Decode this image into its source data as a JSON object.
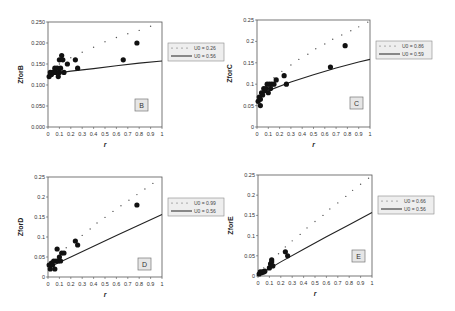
{
  "chart_data": [
    {
      "type": "scatter",
      "panel_label": "B",
      "ylabel": "ZforB",
      "xlabel": "r",
      "xlim": [
        0,
        1
      ],
      "ylim": [
        0,
        0.25
      ],
      "xticks": [
        "0",
        "0.1",
        "0.2",
        "0.3",
        "0.4",
        "0.5",
        "0.6",
        "0.7",
        "0.8",
        "0.9",
        "1"
      ],
      "yticks": [
        "0.000",
        "0.050",
        "0.100",
        "0.150",
        "0.200",
        "0.250"
      ],
      "ytick_values": [
        0,
        0.05,
        0.1,
        0.15,
        0.2,
        0.25
      ],
      "legend": [
        "U0 = 0.26",
        "U0 = 0.56"
      ],
      "legend_placement": "right",
      "points": [
        [
          0.01,
          0.12
        ],
        [
          0.02,
          0.13
        ],
        [
          0.03,
          0.125
        ],
        [
          0.04,
          0.13
        ],
        [
          0.05,
          0.13
        ],
        [
          0.06,
          0.14
        ],
        [
          0.07,
          0.13
        ],
        [
          0.08,
          0.14
        ],
        [
          0.09,
          0.12
        ],
        [
          0.1,
          0.16
        ],
        [
          0.1,
          0.13
        ],
        [
          0.11,
          0.14
        ],
        [
          0.12,
          0.17
        ],
        [
          0.13,
          0.16
        ],
        [
          0.14,
          0.13
        ],
        [
          0.17,
          0.15
        ],
        [
          0.24,
          0.16
        ],
        [
          0.26,
          0.14
        ],
        [
          0.66,
          0.16
        ],
        [
          0.78,
          0.2
        ]
      ],
      "dotted_line": [
        [
          0.1,
          0.15
        ],
        [
          0.2,
          0.165
        ],
        [
          0.3,
          0.178
        ],
        [
          0.4,
          0.19
        ],
        [
          0.5,
          0.203
        ],
        [
          0.6,
          0.213
        ],
        [
          0.7,
          0.222
        ],
        [
          0.8,
          0.23
        ],
        [
          0.9,
          0.24
        ]
      ],
      "solid_line": [
        [
          0,
          0.125
        ],
        [
          0.2,
          0.133
        ],
        [
          0.4,
          0.139
        ],
        [
          0.6,
          0.146
        ],
        [
          0.8,
          0.152
        ],
        [
          1.0,
          0.157
        ]
      ]
    },
    {
      "type": "scatter",
      "panel_label": "C",
      "ylabel": "ZforC",
      "xlabel": "r",
      "xlim": [
        0,
        1
      ],
      "ylim": [
        0,
        0.25
      ],
      "xticks": [
        "0",
        "0.1",
        "0.2",
        "0.3",
        "0.4",
        "0.5",
        "0.6",
        "0.7",
        "0.8",
        "0.9",
        "1"
      ],
      "yticks": [
        "0",
        "0.05",
        "0.1",
        "0.15",
        "0.2",
        "0.25"
      ],
      "ytick_values": [
        0,
        0.05,
        0.1,
        0.15,
        0.2,
        0.25
      ],
      "legend": [
        "U0 = 0.86",
        "U0 = 0.59"
      ],
      "legend_placement": "right",
      "points": [
        [
          0.01,
          0.06
        ],
        [
          0.02,
          0.07
        ],
        [
          0.03,
          0.065
        ],
        [
          0.03,
          0.05
        ],
        [
          0.04,
          0.08
        ],
        [
          0.05,
          0.075
        ],
        [
          0.06,
          0.09
        ],
        [
          0.07,
          0.085
        ],
        [
          0.08,
          0.09
        ],
        [
          0.09,
          0.1
        ],
        [
          0.1,
          0.08
        ],
        [
          0.11,
          0.1
        ],
        [
          0.12,
          0.09
        ],
        [
          0.13,
          0.1
        ],
        [
          0.15,
          0.1
        ],
        [
          0.17,
          0.11
        ],
        [
          0.24,
          0.12
        ],
        [
          0.26,
          0.1
        ],
        [
          0.65,
          0.14
        ],
        [
          0.78,
          0.19
        ]
      ],
      "dotted_line": [
        [
          0.15,
          0.115
        ],
        [
          0.22,
          0.13
        ],
        [
          0.3,
          0.145
        ],
        [
          0.37,
          0.158
        ],
        [
          0.45,
          0.17
        ],
        [
          0.52,
          0.183
        ],
        [
          0.6,
          0.194
        ],
        [
          0.67,
          0.205
        ],
        [
          0.75,
          0.215
        ],
        [
          0.83,
          0.225
        ],
        [
          0.9,
          0.234
        ],
        [
          0.98,
          0.245
        ]
      ],
      "solid_line": [
        [
          0.1,
          0.085
        ],
        [
          0.3,
          0.105
        ],
        [
          0.5,
          0.122
        ],
        [
          0.7,
          0.138
        ],
        [
          0.9,
          0.152
        ],
        [
          1.0,
          0.158
        ]
      ]
    },
    {
      "type": "scatter",
      "panel_label": "D",
      "ylabel": "ZforD",
      "xlabel": "r",
      "xlim": [
        0,
        1
      ],
      "ylim": [
        0,
        0.25
      ],
      "xticks": [
        "0",
        "0.1",
        "0.2",
        "0.3",
        "0.4",
        "0.5",
        "0.6",
        "0.7",
        "0.8",
        "0.9",
        "1"
      ],
      "yticks": [
        "0",
        "0.05",
        "0.1",
        "0.15",
        "0.2",
        "0.25"
      ],
      "ytick_values": [
        0,
        0.05,
        0.1,
        0.15,
        0.2,
        0.25
      ],
      "legend": [
        "U0 = 0.99",
        "U0 = 0.56"
      ],
      "legend_placement": "right",
      "points": [
        [
          0.01,
          0.03
        ],
        [
          0.02,
          0.02
        ],
        [
          0.03,
          0.035
        ],
        [
          0.04,
          0.03
        ],
        [
          0.05,
          0.04
        ],
        [
          0.06,
          0.02
        ],
        [
          0.07,
          0.04
        ],
        [
          0.08,
          0.07
        ],
        [
          0.09,
          0.04
        ],
        [
          0.1,
          0.05
        ],
        [
          0.11,
          0.04
        ],
        [
          0.12,
          0.06
        ],
        [
          0.14,
          0.06
        ],
        [
          0.24,
          0.09
        ],
        [
          0.26,
          0.08
        ],
        [
          0.78,
          0.18
        ]
      ],
      "dotted_line": [
        [
          0.16,
          0.073
        ],
        [
          0.23,
          0.088
        ],
        [
          0.3,
          0.104
        ],
        [
          0.37,
          0.12
        ],
        [
          0.43,
          0.135
        ],
        [
          0.5,
          0.149
        ],
        [
          0.57,
          0.164
        ],
        [
          0.64,
          0.178
        ],
        [
          0.71,
          0.192
        ],
        [
          0.78,
          0.206
        ],
        [
          0.85,
          0.22
        ],
        [
          0.92,
          0.234
        ]
      ],
      "solid_line": [
        [
          0.05,
          0.03
        ],
        [
          0.2,
          0.05
        ],
        [
          0.4,
          0.077
        ],
        [
          0.6,
          0.104
        ],
        [
          0.8,
          0.13
        ],
        [
          1.0,
          0.156
        ]
      ]
    },
    {
      "type": "scatter",
      "panel_label": "E",
      "ylabel": "ZforE",
      "xlabel": "r",
      "xlim": [
        0,
        1
      ],
      "ylim": [
        0,
        0.25
      ],
      "xticks": [
        "0",
        "0.1",
        "0.2",
        "0.3",
        "0.4",
        "0.5",
        "0.6",
        "0.7",
        "0.8",
        "0.9",
        "1"
      ],
      "yticks": [
        "0",
        "0.05",
        "0.1",
        "0.15",
        "0.2",
        "0.25"
      ],
      "ytick_values": [
        0,
        0.05,
        0.1,
        0.15,
        0.2,
        0.25
      ],
      "legend": [
        "U0 = 0.66",
        "U0 = 0.56"
      ],
      "legend_placement": "right",
      "points": [
        [
          0.01,
          0.005
        ],
        [
          0.02,
          0.01
        ],
        [
          0.03,
          0.008
        ],
        [
          0.04,
          0.01
        ],
        [
          0.05,
          0.01
        ],
        [
          0.06,
          0.012
        ],
        [
          0.1,
          0.02
        ],
        [
          0.11,
          0.03
        ],
        [
          0.12,
          0.04
        ],
        [
          0.12,
          0.035
        ],
        [
          0.13,
          0.025
        ],
        [
          0.24,
          0.06
        ],
        [
          0.26,
          0.05
        ]
      ],
      "dotted_line": [
        [
          0.05,
          0.02
        ],
        [
          0.18,
          0.055
        ],
        [
          0.24,
          0.072
        ],
        [
          0.3,
          0.087
        ],
        [
          0.37,
          0.103
        ],
        [
          0.43,
          0.119
        ],
        [
          0.5,
          0.135
        ],
        [
          0.57,
          0.15
        ],
        [
          0.63,
          0.166
        ],
        [
          0.7,
          0.181
        ],
        [
          0.77,
          0.197
        ],
        [
          0.83,
          0.212
        ],
        [
          0.9,
          0.227
        ],
        [
          0.97,
          0.242
        ]
      ],
      "solid_line": [
        [
          0.05,
          0.01
        ],
        [
          0.2,
          0.035
        ],
        [
          0.4,
          0.066
        ],
        [
          0.6,
          0.097
        ],
        [
          0.8,
          0.127
        ],
        [
          1.0,
          0.157
        ]
      ]
    }
  ]
}
